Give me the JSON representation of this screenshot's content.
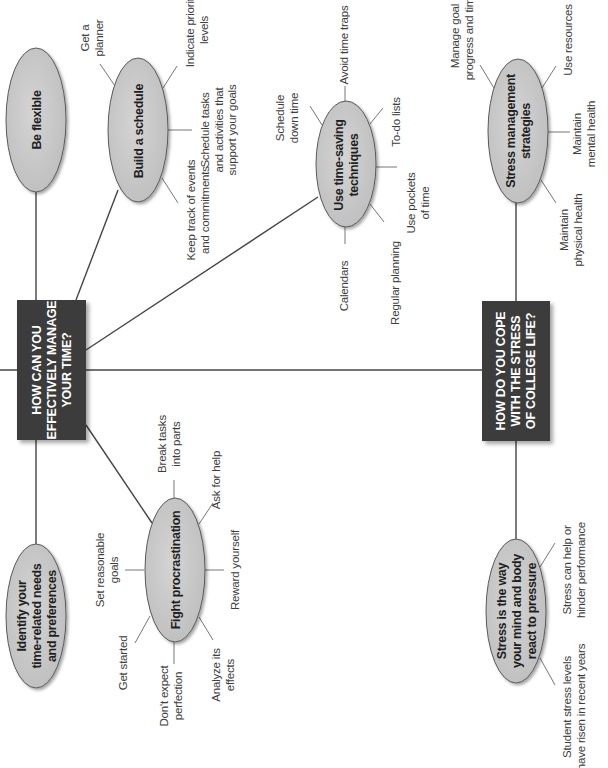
{
  "diagram": {
    "orientation": "rotated-90-ccw",
    "colors": {
      "question_box": "#3c3c3c",
      "question_text": "#ffffff",
      "ellipse_fill": "#c9c9c9",
      "ellipse_stroke": "#5a5a5a",
      "line": "#444444",
      "label_text": "#3d3d3d"
    },
    "questions": [
      {
        "id": "time",
        "text": "HOW CAN YOU\nEFFECTIVELY MANAGE\nYOUR TIME?"
      },
      {
        "id": "stress",
        "text": "HOW DO YOU COPE\nWITH THE STRESS\nOF COLLEGE LIFE?"
      }
    ],
    "nodes": {
      "be_flexible": {
        "text": "Be flexible"
      },
      "build_schedule": {
        "text": "Build a schedule",
        "children": [
          "Get a\nplanner",
          "Indicate priority\nlevels",
          "Schedule tasks\nand activities that\nsupport your goals",
          "Keep track of events\nand commitments"
        ]
      },
      "time_saving": {
        "text": "Use time-saving\ntechniques",
        "children": [
          "Schedule\ndown time",
          "Avoid time traps",
          "To-do lists",
          "Use pockets\nof time",
          "Regular planning",
          "Calendars"
        ]
      },
      "stress_mgmt": {
        "text": "Stress management\nstrategies",
        "children": [
          "Manage goal\nprogress and time",
          "Use resources",
          "Maintain\nmental health",
          "Maintain\nphysical health"
        ]
      },
      "identify": {
        "text": "Identify your\ntime-related needs\nand preferences"
      },
      "fight_procrastination": {
        "text": "Fight procrastination",
        "children": [
          "Break tasks\ninto parts",
          "Ask for help",
          "Reward yourself",
          "Analyze its\neffects",
          "Don't expect\nperfection",
          "Get started",
          "Set reasonable\ngoals"
        ]
      },
      "stress_definition": {
        "text": "Stress is the way\nyour mind and body\nreact to pressure",
        "children": [
          "Stress can help or\nhinder performance",
          "Student stress levels\nhave risen in recent years"
        ]
      }
    }
  }
}
